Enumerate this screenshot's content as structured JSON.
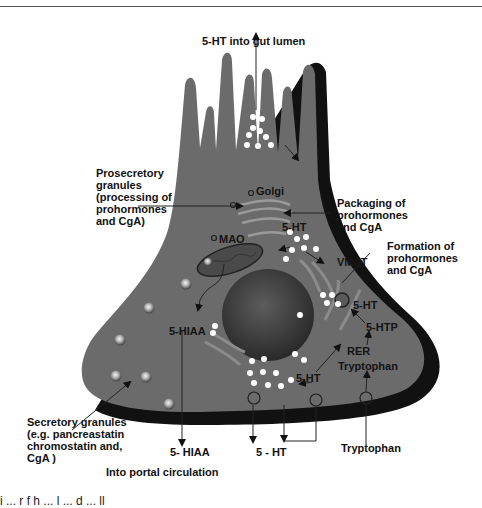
{
  "header": {
    "clipped_text": "g   p"
  },
  "diagram": {
    "title_top": "5-HT into gut lumen",
    "labels": {
      "prosecretory": "Prosecretory\ngranules\n(processing of\nprohormones\nand CgA)",
      "packaging": "Packaging of\nprohormones\nand CgA",
      "formation": "Formation of\nprohormones\nand CgA",
      "secretory": "Secretory granules\n(e.g. pancreastatin\nchromostatin and,\nCgA )",
      "golgi": "Golgi",
      "mao": "MAO",
      "vmat": "VMAT",
      "ht_upper": "5-HT",
      "ht_right": "5-HT",
      "htp": "5-HTP",
      "rer": "RER",
      "tryptophan_in": "Tryptophan",
      "hiaa_in": "5-HIAA",
      "ht_lower": "5-HT",
      "hiaa_out": "5- HIAA",
      "ht_out": "5 - HT",
      "tryptophan_out": "Tryptophan",
      "portal": "Into portal circulation"
    },
    "colors": {
      "cell": "#6b6b6b",
      "shadow": "#111111",
      "nucleus": "#3a3a3a",
      "granule": "#ffffff"
    }
  },
  "caption": {
    "clipped_text": "i   ...   r   f   h   ...   l   ...   d   ...   ll"
  }
}
